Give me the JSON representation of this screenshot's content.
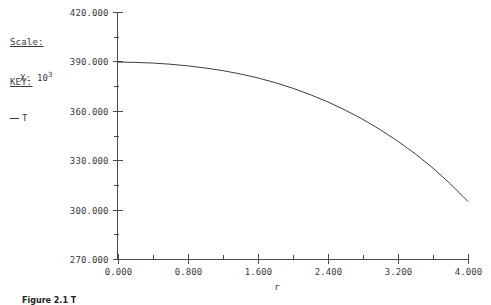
{
  "annotations": {
    "scale": {
      "title": "Scale:",
      "variable": "X:",
      "mantissa": "10",
      "exponent": "3"
    },
    "key": {
      "title": "KEY:",
      "series_label": "T"
    }
  },
  "caption": {
    "text": "Figure 2.1 T"
  },
  "chart_data": {
    "type": "line",
    "title": "",
    "subtitle": "",
    "xlabel": "r",
    "ylabel": "",
    "xlim": [
      0.0,
      4.0
    ],
    "ylim": [
      270.0,
      420.0
    ],
    "grid": false,
    "legend_position": "upper-left",
    "x_tick_labels": [
      "0.000",
      "0.800",
      "1.600",
      "2.400",
      "3.200",
      "4.000"
    ],
    "x_tick_values": [
      0.0,
      0.8,
      1.6,
      2.4,
      3.2,
      4.0
    ],
    "x_minor_ticks_between": 1,
    "y_tick_labels": [
      "420.000",
      "390.000",
      "360.000",
      "330.000",
      "300.000",
      "270.000"
    ],
    "y_tick_values": [
      420.0,
      390.0,
      360.0,
      330.0,
      300.0,
      270.0
    ],
    "y_minor_ticks_between": 1,
    "x_scale_note": "X: 10^3",
    "series": [
      {
        "name": "T",
        "color": "#3d3d3d",
        "x": [
          0.0,
          0.2,
          0.4,
          0.6,
          0.8,
          1.0,
          1.2,
          1.4,
          1.6,
          1.8,
          2.0,
          2.2,
          2.4,
          2.6,
          2.8,
          3.0,
          3.2,
          3.4,
          3.6,
          3.8,
          4.0
        ],
        "y": [
          389.6,
          389.4,
          389.0,
          388.3,
          387.3,
          386.0,
          384.4,
          382.4,
          380.0,
          377.1,
          373.7,
          369.8,
          365.4,
          360.4,
          354.8,
          348.5,
          341.5,
          333.8,
          325.2,
          315.6,
          304.9
        ]
      }
    ]
  }
}
